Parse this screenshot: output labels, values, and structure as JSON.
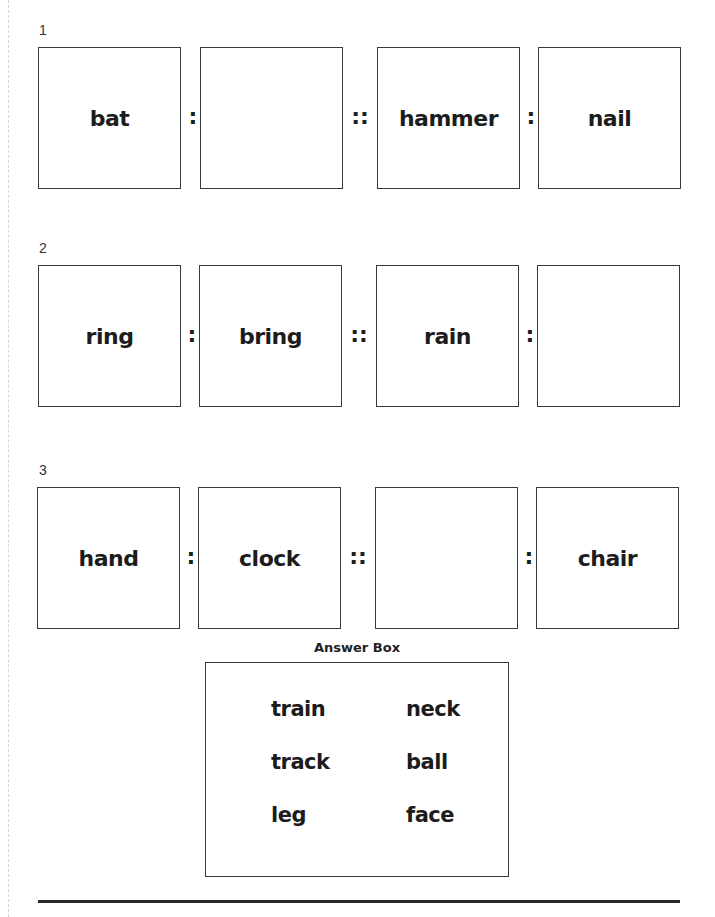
{
  "questions": [
    {
      "number": "1",
      "terms": [
        "bat",
        "",
        "hammer",
        "nail"
      ],
      "separators": [
        ":",
        "::",
        ":"
      ]
    },
    {
      "number": "2",
      "terms": [
        "ring",
        "bring",
        "rain",
        ""
      ],
      "separators": [
        ":",
        "::",
        ":"
      ]
    },
    {
      "number": "3",
      "terms": [
        "hand",
        "clock",
        "",
        "chair"
      ],
      "separators": [
        ":",
        "::",
        ":"
      ]
    }
  ],
  "answer_box": {
    "title": "Answer Box",
    "words": [
      "train",
      "neck",
      "track",
      "ball",
      "leg",
      "face"
    ]
  }
}
